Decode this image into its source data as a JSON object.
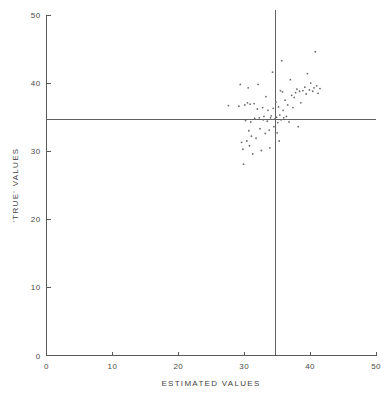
{
  "chart_data": {
    "type": "scatter",
    "title": "",
    "subtitle": "",
    "xlabel": "ESTIMATED VALUES",
    "ylabel": "'TRUE' VALUES",
    "xlim": [
      0,
      50
    ],
    "ylim": [
      0,
      50
    ],
    "xticks": [
      0,
      10,
      20,
      30,
      40,
      50
    ],
    "yticks": [
      0,
      10,
      20,
      30,
      40,
      50
    ],
    "xtick_labels": [
      "0",
      "10",
      "20",
      "30",
      "40",
      "50"
    ],
    "ytick_labels": [
      "0",
      "10",
      "20",
      "30",
      "40",
      "50"
    ],
    "grid": false,
    "legend": false,
    "legend_position": "none",
    "marker": "dot",
    "marker_color": "#6b6b6b",
    "reference_lines": [
      {
        "name": "vertical-reference-line",
        "orientation": "vertical",
        "value": 34.7,
        "color": "#636363"
      },
      {
        "name": "horizontal-reference-line",
        "orientation": "horizontal",
        "value": 34.7,
        "color": "#636363"
      }
    ],
    "series": [
      {
        "name": "observations",
        "points": [
          [
            27.6,
            36.7
          ],
          [
            29.2,
            36.6
          ],
          [
            29.4,
            39.8
          ],
          [
            29.6,
            31.3
          ],
          [
            29.8,
            30.3
          ],
          [
            29.9,
            28.1
          ],
          [
            30.1,
            36.8
          ],
          [
            30.2,
            34.5
          ],
          [
            30.4,
            31.5
          ],
          [
            30.5,
            37.1
          ],
          [
            30.6,
            39.3
          ],
          [
            30.7,
            33.0
          ],
          [
            30.8,
            30.8
          ],
          [
            30.9,
            36.9
          ],
          [
            31.0,
            34.3
          ],
          [
            31.1,
            32.2
          ],
          [
            31.3,
            29.6
          ],
          [
            31.5,
            37.0
          ],
          [
            31.6,
            34.8
          ],
          [
            31.8,
            31.9
          ],
          [
            32.0,
            36.2
          ],
          [
            32.1,
            39.8
          ],
          [
            32.3,
            34.9
          ],
          [
            32.4,
            33.3
          ],
          [
            32.6,
            30.1
          ],
          [
            32.8,
            36.4
          ],
          [
            32.9,
            34.6
          ],
          [
            33.0,
            35.1
          ],
          [
            33.2,
            32.6
          ],
          [
            33.3,
            38.0
          ],
          [
            33.5,
            34.4
          ],
          [
            33.6,
            36.0
          ],
          [
            33.8,
            33.1
          ],
          [
            33.9,
            30.5
          ],
          [
            34.0,
            34.9
          ],
          [
            34.1,
            35.2
          ],
          [
            34.3,
            41.6
          ],
          [
            34.4,
            36.3
          ],
          [
            34.5,
            33.6
          ],
          [
            34.6,
            34.7
          ],
          [
            34.8,
            37.2
          ],
          [
            34.9,
            35.0
          ],
          [
            35.0,
            32.7
          ],
          [
            35.1,
            34.2
          ],
          [
            35.2,
            36.5
          ],
          [
            35.3,
            31.5
          ],
          [
            35.4,
            35.3
          ],
          [
            35.5,
            38.9
          ],
          [
            35.6,
            34.6
          ],
          [
            35.7,
            43.3
          ],
          [
            35.8,
            38.7
          ],
          [
            35.9,
            36.0
          ],
          [
            36.0,
            34.9
          ],
          [
            36.2,
            37.5
          ],
          [
            36.4,
            35.1
          ],
          [
            36.6,
            36.8
          ],
          [
            36.8,
            34.3
          ],
          [
            37.0,
            40.5
          ],
          [
            37.2,
            38.2
          ],
          [
            37.4,
            36.4
          ],
          [
            37.6,
            37.9
          ],
          [
            37.8,
            38.6
          ],
          [
            38.0,
            39.1
          ],
          [
            38.2,
            33.6
          ],
          [
            38.4,
            38.8
          ],
          [
            38.6,
            37.1
          ],
          [
            38.9,
            38.9
          ],
          [
            39.2,
            39.4
          ],
          [
            39.4,
            38.4
          ],
          [
            39.6,
            41.4
          ],
          [
            39.9,
            39.0
          ],
          [
            40.1,
            40.0
          ],
          [
            40.4,
            38.8
          ],
          [
            40.6,
            39.3
          ],
          [
            40.8,
            44.6
          ],
          [
            41.0,
            39.6
          ],
          [
            41.2,
            38.5
          ],
          [
            41.5,
            39.2
          ]
        ]
      }
    ]
  }
}
